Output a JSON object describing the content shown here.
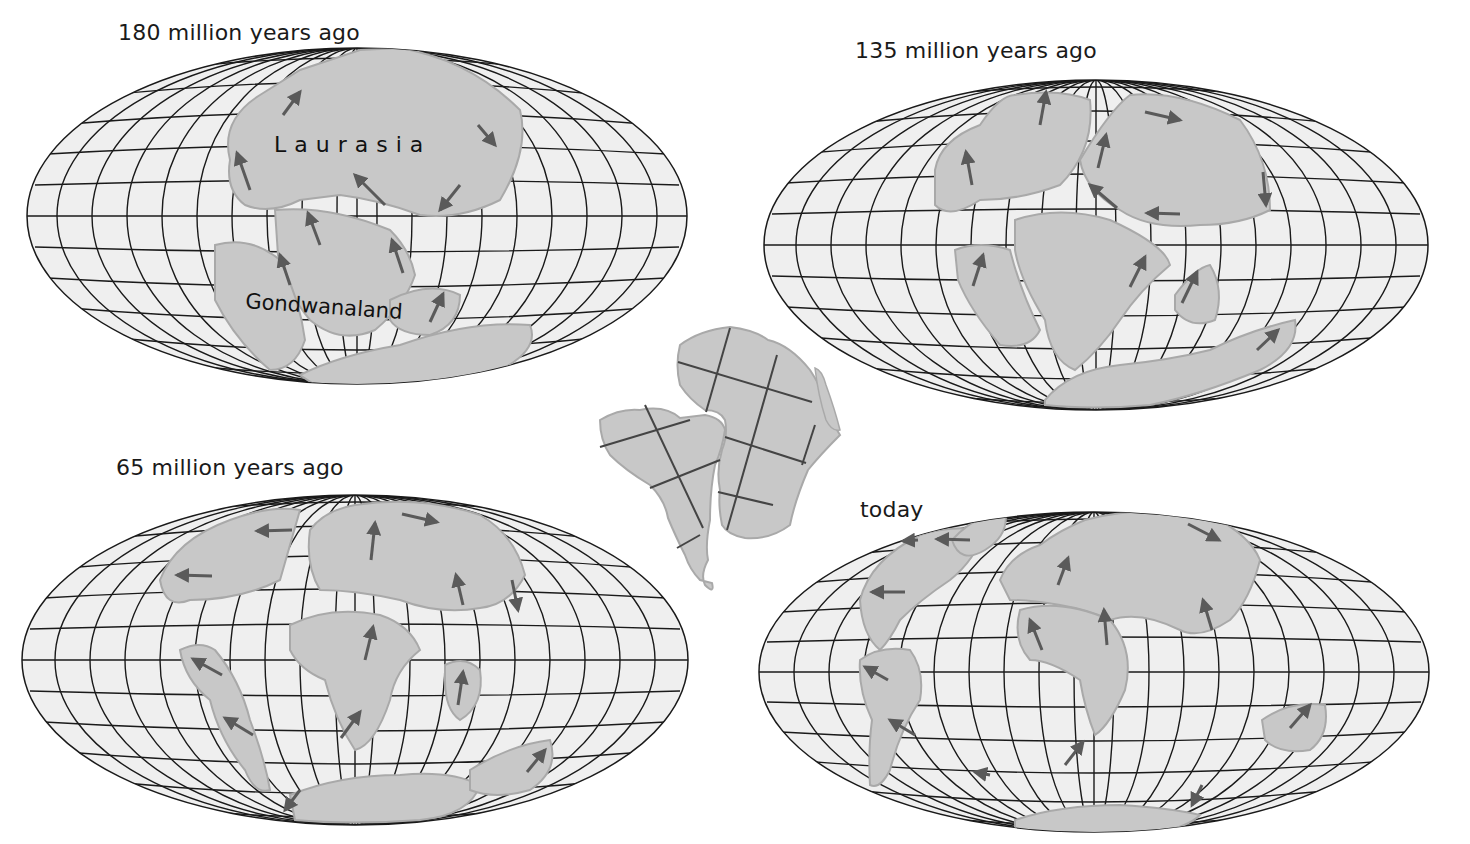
{
  "figure": {
    "panels": [
      {
        "id": "p180",
        "title": "180 million years ago",
        "labels": [
          "Laurasia",
          "Gondwanaland"
        ]
      },
      {
        "id": "p135",
        "title": "135 million years ago",
        "labels": []
      },
      {
        "id": "p65",
        "title": "65 million years ago",
        "labels": []
      },
      {
        "id": "ptoday",
        "title": "today",
        "labels": []
      }
    ],
    "inset": {
      "description": "South America and Africa fitted together"
    },
    "colors": {
      "land": "#c8c8c8",
      "land_outline": "#a9a9a9",
      "ocean": "#efefef",
      "grid": "#1a1a1a",
      "arrow": "#5a5a5a",
      "text": "#1a1a1a"
    }
  }
}
